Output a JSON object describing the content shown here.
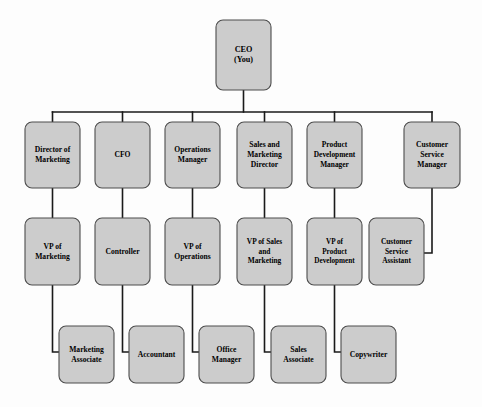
{
  "chart": {
    "type": "org-chart",
    "colors": {
      "box_fill": "#cccccc",
      "box_stroke": "#4d4d4d",
      "connector": "#1a1a1a",
      "background": "#fdfdfd",
      "text": "#000000"
    },
    "levels": [
      {
        "level": 1,
        "nodes": [
          {
            "id": "ceo",
            "lines": [
              "CEO",
              "(You)"
            ],
            "x": 216,
            "y": 20,
            "w": 55,
            "h": 70,
            "font": 8.2
          }
        ]
      },
      {
        "level": 2,
        "nodes": [
          {
            "id": "director-of-marketing",
            "lines": [
              "Director of",
              "Marketing"
            ],
            "x": 25,
            "y": 122,
            "w": 55,
            "h": 66,
            "font": 7.6
          },
          {
            "id": "cfo",
            "lines": [
              "CFO"
            ],
            "x": 95,
            "y": 122,
            "w": 55,
            "h": 66,
            "font": 7.6
          },
          {
            "id": "operations-manager",
            "lines": [
              "Operations",
              "Manager"
            ],
            "x": 165,
            "y": 122,
            "w": 55,
            "h": 66,
            "font": 7.6
          },
          {
            "id": "sales-and-marketing-director",
            "lines": [
              "Sales and",
              "Marketing",
              "Director"
            ],
            "x": 237,
            "y": 122,
            "w": 55,
            "h": 66,
            "font": 7.6
          },
          {
            "id": "product-development-manager",
            "lines": [
              "Product",
              "Development",
              "Manager"
            ],
            "x": 307,
            "y": 122,
            "w": 55,
            "h": 66,
            "font": 7.4
          },
          {
            "id": "customer-service-manager",
            "lines": [
              "Customer",
              "Service",
              "Manager"
            ],
            "x": 404,
            "y": 122,
            "w": 56,
            "h": 66,
            "font": 7.6
          }
        ]
      },
      {
        "level": 3,
        "nodes": [
          {
            "id": "vp-of-marketing",
            "lines": [
              "VP of",
              "Marketing"
            ],
            "x": 25,
            "y": 218,
            "w": 55,
            "h": 67,
            "font": 7.6
          },
          {
            "id": "controller",
            "lines": [
              "Controller"
            ],
            "x": 95,
            "y": 218,
            "w": 55,
            "h": 67,
            "font": 7.6
          },
          {
            "id": "vp-of-operations",
            "lines": [
              "VP of",
              "Operations"
            ],
            "x": 165,
            "y": 218,
            "w": 55,
            "h": 67,
            "font": 7.6
          },
          {
            "id": "vp-of-sales-and-marketing",
            "lines": [
              "VP of Sales",
              "and",
              "Marketing"
            ],
            "x": 237,
            "y": 218,
            "w": 55,
            "h": 67,
            "font": 7.4
          },
          {
            "id": "vp-of-product-development",
            "lines": [
              "VP of",
              "Product",
              "Development"
            ],
            "x": 307,
            "y": 218,
            "w": 55,
            "h": 67,
            "font": 7.2
          },
          {
            "id": "customer-service-assistant",
            "lines": [
              "Customer",
              "Service",
              "Assistant"
            ],
            "x": 369,
            "y": 218,
            "w": 55,
            "h": 67,
            "font": 7.4
          }
        ]
      },
      {
        "level": 4,
        "nodes": [
          {
            "id": "marketing-associate",
            "lines": [
              "Marketing",
              "Associate"
            ],
            "x": 59,
            "y": 326,
            "w": 55,
            "h": 57,
            "font": 7.6
          },
          {
            "id": "accountant",
            "lines": [
              "Accountant"
            ],
            "x": 129,
            "y": 326,
            "w": 55,
            "h": 57,
            "font": 7.6
          },
          {
            "id": "office-manager",
            "lines": [
              "Office",
              "Manager"
            ],
            "x": 199,
            "y": 326,
            "w": 55,
            "h": 57,
            "font": 7.6
          },
          {
            "id": "sales-associate",
            "lines": [
              "Sales",
              "Associate"
            ],
            "x": 271,
            "y": 326,
            "w": 55,
            "h": 57,
            "font": 7.6
          },
          {
            "id": "copywriter",
            "lines": [
              "Copywriter"
            ],
            "x": 341,
            "y": 326,
            "w": 55,
            "h": 57,
            "font": 7.6
          }
        ]
      }
    ],
    "connectors": [
      {
        "id": "ceo-to-bus",
        "type": "path",
        "d": "M 243.5 90 L 243.5 112"
      },
      {
        "id": "bus-horizontal",
        "type": "path",
        "d": "M 52.5 112 L 432 112"
      },
      {
        "id": "bus-to-director-of-marketing",
        "type": "path",
        "d": "M 52.5 112 L 52.5 122"
      },
      {
        "id": "bus-to-cfo",
        "type": "path",
        "d": "M 122.5 112 L 122.5 122"
      },
      {
        "id": "bus-to-operations-manager",
        "type": "path",
        "d": "M 192.5 112 L 192.5 122"
      },
      {
        "id": "bus-to-sales-and-marketing-director",
        "type": "path",
        "d": "M 264.5 112 L 264.5 122"
      },
      {
        "id": "bus-to-product-development-manager",
        "type": "path",
        "d": "M 334.5 112 L 334.5 122"
      },
      {
        "id": "bus-to-customer-service-manager",
        "type": "path",
        "d": "M 432 112 L 432 122"
      },
      {
        "id": "director-of-marketing-to-vp",
        "type": "path",
        "d": "M 52.5 188 L 52.5 218"
      },
      {
        "id": "cfo-to-controller",
        "type": "path",
        "d": "M 122.5 188 L 122.5 218"
      },
      {
        "id": "operations-manager-to-vp",
        "type": "path",
        "d": "M 192.5 188 L 192.5 218"
      },
      {
        "id": "sales-director-to-vp",
        "type": "path",
        "d": "M 264.5 188 L 264.5 218"
      },
      {
        "id": "product-manager-to-vp",
        "type": "path",
        "d": "M 334.5 188 L 334.5 218"
      },
      {
        "id": "customer-service-manager-to-assistant",
        "type": "path",
        "d": "M 432 188 L 432 253 L 424 253"
      },
      {
        "id": "vp-marketing-to-marketing-associate",
        "type": "path",
        "d": "M 52.5 285 L 52.5 352 L 59 352"
      },
      {
        "id": "controller-to-accountant",
        "type": "path",
        "d": "M 122.5 285 L 122.5 352 L 129 352"
      },
      {
        "id": "vp-operations-to-office-manager",
        "type": "path",
        "d": "M 192.5 285 L 192.5 352 L 199 352"
      },
      {
        "id": "vp-sales-to-sales-associate",
        "type": "path",
        "d": "M 264.5 285 L 264.5 352 L 271 352"
      },
      {
        "id": "vp-product-to-copywriter",
        "type": "path",
        "d": "M 334.5 285 L 334.5 352 L 341 352"
      }
    ]
  }
}
